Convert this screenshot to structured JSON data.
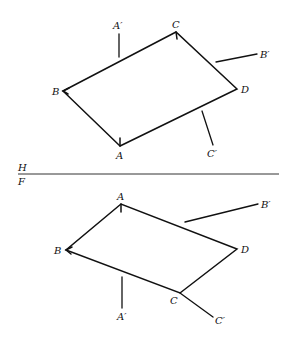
{
  "diagram": {
    "fold_line": {
      "upper_label": "H",
      "lower_label": "F"
    },
    "top_view": {
      "vertices": {
        "A": {
          "label": "A",
          "x": 120,
          "y": 146
        },
        "B": {
          "label": "B",
          "x": 63,
          "y": 91
        },
        "C": {
          "label": "C",
          "x": 176,
          "y": 32
        },
        "D": {
          "label": "D",
          "x": 237,
          "y": 89
        }
      },
      "rays": {
        "A_prime": {
          "label": "A′"
        },
        "B_prime": {
          "label": "B′"
        },
        "C_prime": {
          "label": "C′"
        }
      }
    },
    "front_view": {
      "vertices": {
        "A": {
          "label": "A",
          "x": 121,
          "y": 204
        },
        "B": {
          "label": "B",
          "x": 66,
          "y": 250
        },
        "C": {
          "label": "C",
          "x": 180,
          "y": 293
        },
        "D": {
          "label": "D",
          "x": 237,
          "y": 249
        }
      },
      "rays": {
        "A_prime": {
          "label": "A′"
        },
        "B_prime": {
          "label": "B′"
        },
        "C_prime": {
          "label": "C′"
        }
      }
    }
  }
}
